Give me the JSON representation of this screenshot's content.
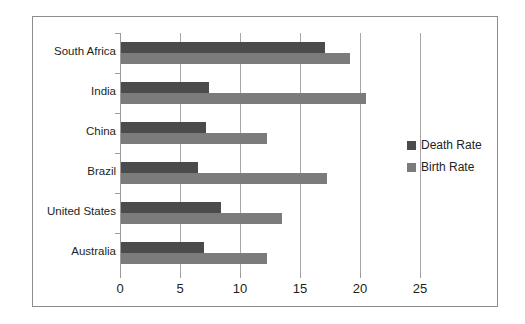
{
  "chart_data": {
    "type": "bar",
    "orientation": "horizontal",
    "title": "",
    "xlabel": "",
    "ylabel": "",
    "xlim": [
      0,
      27.5
    ],
    "xticks": [
      0,
      5,
      10,
      15,
      20,
      25
    ],
    "xtick_labels": [
      "0",
      "5",
      "10",
      "15",
      "20",
      "25"
    ],
    "grid": "vertical",
    "legend_position": "right",
    "categories": [
      "South Africa",
      "India",
      "China",
      "Brazil",
      "United States",
      "Australia"
    ],
    "series": [
      {
        "name": "Death Rate",
        "color": "#4b4b4b",
        "values": [
          17.0,
          7.3,
          7.1,
          6.4,
          8.3,
          6.9
        ]
      },
      {
        "name": "Birth Rate",
        "color": "#7b7b7b",
        "values": [
          19.1,
          20.4,
          12.2,
          17.2,
          13.4,
          12.2
        ]
      }
    ]
  },
  "legend": {
    "items": [
      {
        "label": "Death Rate",
        "swatch": "#4b4b4b"
      },
      {
        "label": "Birth Rate",
        "swatch": "#7b7b7b"
      }
    ]
  },
  "colors": {
    "death_rate": "#4b4b4b",
    "birth_rate": "#7b7b7b",
    "gridline": "#a6a6a6",
    "frame": "#8d8d8d",
    "text": "#231f20",
    "background": "#ffffff"
  }
}
